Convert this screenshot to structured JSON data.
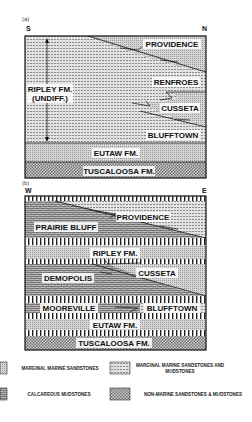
{
  "panels": [
    {
      "id": "a",
      "label": "(a)",
      "left_dir": "S",
      "right_dir": "N",
      "units": {
        "providence": "PROVIDENCE",
        "renfroes": "RENFROES",
        "ripley": "RIPLEY  FM.",
        "ripley_sub": "(UNDIFF.)",
        "cusseta": "CUSSETA",
        "blufftown": "BLUFFTOWN",
        "eutaw": "EUTAW  FM.",
        "tuscaloosa": "TUSCALOOSA  FM."
      }
    },
    {
      "id": "b",
      "label": "(b)",
      "left_dir": "W",
      "right_dir": "E",
      "units": {
        "providence": "PROVIDENCE",
        "prairie_bluff": "PRAIRIE BLUFF",
        "ripley": "RIPLEY FM.",
        "demopolis": "DEMOPOLIS",
        "cusseta": "CUSSETA",
        "mooreville": "MOOREVILLE",
        "blufftown": "BLUFFTOWN",
        "eutaw": "EUTAW  FM.",
        "tuscaloosa": "TUSCALOOSA  FM."
      }
    }
  ],
  "legend": [
    {
      "pattern": "marginal-marine-sandstone",
      "label": "MARGINAL MARINE SANDSTONES"
    },
    {
      "pattern": "marginal-marine-sand-mud",
      "label": "MARGINAL MARINE SANDSTONES AND MUDSTONES"
    },
    {
      "pattern": "calcareous-mudstone",
      "label": "CALCAREOUS MUDSTONES"
    },
    {
      "pattern": "non-marine",
      "label": "NON-MARINE SANDSTONES & MUDSTONES"
    }
  ]
}
